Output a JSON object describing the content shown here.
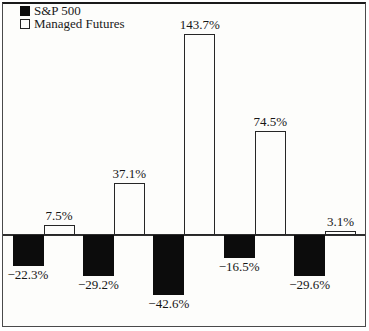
{
  "figure": {
    "legend": [
      {
        "label": "S&P 500",
        "swatch": "black"
      },
      {
        "label": "Managed Futures",
        "swatch": "white"
      }
    ]
  },
  "chart_data": {
    "type": "bar",
    "title": "",
    "xlabel": "",
    "ylabel": "",
    "grid": false,
    "legend_position": "top-left",
    "value_labels": "outside-end",
    "baseline": 0,
    "ylim": [
      -55,
      160
    ],
    "unit": "%",
    "series": [
      {
        "name": "S&P 500",
        "fill": "#0c0c0c",
        "values": [
          -22.3,
          -29.2,
          -42.6,
          -16.5,
          -29.6
        ],
        "labels": [
          "−22.3%",
          "−29.2%",
          "−42.6%",
          "−16.5%",
          "−29.6%"
        ]
      },
      {
        "name": "Managed Futures",
        "fill": "#ffffff",
        "values": [
          7.5,
          37.1,
          143.7,
          74.5,
          3.1
        ],
        "labels": [
          "7.5%",
          "37.1%",
          "143.7%",
          "74.5%",
          "3.1%"
        ]
      }
    ]
  },
  "colors": {
    "bar_black": "#0c0c0c",
    "bar_white_fill": "#fdfdfb",
    "outline": "#262626",
    "background": "#fdfdfb"
  }
}
